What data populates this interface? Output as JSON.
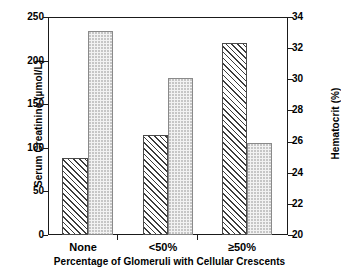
{
  "chart_data": {
    "type": "bar",
    "title": "",
    "subtitle": "",
    "xlabel": "Percentage of Glomeruli with Cellular Crescents",
    "categories": [
      "None",
      "<50%",
      "≥50%"
    ],
    "series": [
      {
        "name": "Serum Creatinine",
        "axis": "left",
        "unit": "µmol/L",
        "fill": "diagonal-hatch",
        "values": [
          88,
          115,
          220
        ]
      },
      {
        "name": "Hematocrit",
        "axis": "right",
        "unit": "%",
        "fill": "dotted",
        "values": [
          33.1,
          30.1,
          25.9
        ]
      }
    ],
    "left_axis": {
      "label": "Serum Creatinine (µmol/L)",
      "ticks": [
        "250",
        "200",
        "150",
        "100",
        "50",
        "0"
      ],
      "tick_values": [
        250,
        200,
        150,
        100,
        50,
        0
      ],
      "ylim": [
        0,
        250
      ]
    },
    "right_axis": {
      "label": "Hematocrit (%)",
      "ticks": [
        "34",
        "32",
        "30",
        "28",
        "26",
        "24",
        "22",
        "20"
      ],
      "tick_values": [
        34,
        32,
        30,
        28,
        26,
        24,
        22,
        20
      ],
      "ylim": [
        20,
        34
      ]
    },
    "grid": false,
    "legend": "none",
    "colors": {
      "axis": "#1a1a1a",
      "hatch_bar_edge": "#4a4a4a",
      "hatch_bar_pattern": "#3c3c3c",
      "dot_bar_fill": "#f2f2f2",
      "dot_bar_edge": "#8a8a8a",
      "background": "#ffffff"
    }
  }
}
